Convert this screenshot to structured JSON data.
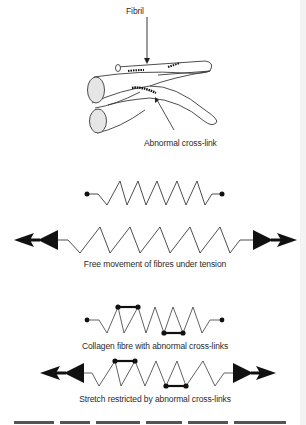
{
  "fibril_panel": {
    "fibril_label": "Fibril",
    "crosslink_label": "Abnormal cross-link"
  },
  "panels": [
    {
      "id": "relaxed-normal",
      "caption": ""
    },
    {
      "id": "tension-normal",
      "caption": "Free movement of fibres under tension"
    },
    {
      "id": "relaxed-crosslinked",
      "caption": "Collagen fibre with abnormal cross-links"
    },
    {
      "id": "tension-crosslinked",
      "caption": "Stretch restricted by abnormal cross-links"
    }
  ],
  "footer": {
    "caption_cut": "Figure ... Abnormal cross-links restrict the elasticity of ..."
  },
  "colors": {
    "line": "#3a3a3a",
    "fill": "#e6e6e6",
    "ink": "#111111"
  }
}
